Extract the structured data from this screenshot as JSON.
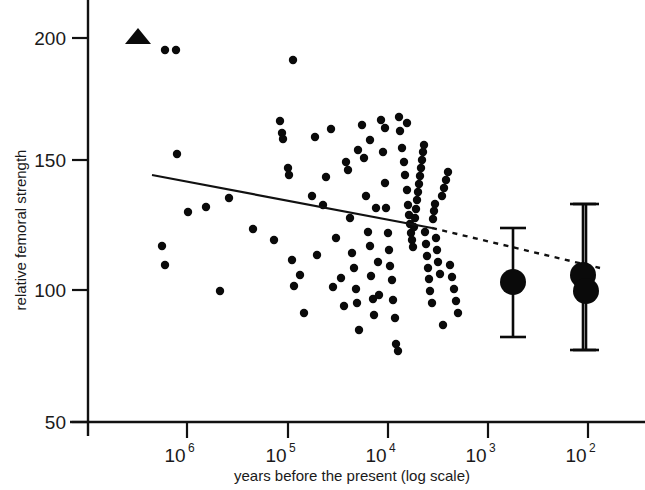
{
  "chart_data": {
    "type": "scatter",
    "title": "",
    "xlabel": "years before the present (log scale)",
    "ylabel": "relative femoral strength",
    "x_scale": "log-reversed",
    "x_tick_labels": [
      "10^6",
      "10^5",
      "10^4",
      "10^3",
      "10^2"
    ],
    "x_tick_bases": [
      "10",
      "10",
      "10",
      "10",
      "10"
    ],
    "x_tick_exponents": [
      "6",
      "5",
      "4",
      "3",
      "2"
    ],
    "x_tick_values": [
      1000000,
      100000,
      10000,
      1000,
      100
    ],
    "x_tick_px": [
      187,
      288,
      388,
      488,
      588
    ],
    "xlim_exponent": [
      6.98,
      1.42
    ],
    "y_tick_labels": [
      "200",
      "150",
      "100",
      "50"
    ],
    "y_tick_values": [
      200,
      150,
      100,
      50
    ],
    "y_tick_px": [
      38,
      160,
      290,
      422
    ],
    "ylim": [
      50,
      212
    ],
    "grid": false,
    "legend": false,
    "series": [
      {
        "name": "individual specimens",
        "marker": "small-filled-circle",
        "color": "#0a0a0a",
        "points_px": [
          [
            165,
            50
          ],
          [
            176,
            50
          ],
          [
            177,
            154
          ],
          [
            162,
            246
          ],
          [
            165,
            265
          ],
          [
            188,
            212
          ],
          [
            206,
            207
          ],
          [
            220,
            291
          ],
          [
            229,
            198
          ],
          [
            253,
            229
          ],
          [
            274,
            240
          ],
          [
            293,
            60
          ],
          [
            280,
            121
          ],
          [
            282,
            133
          ],
          [
            283,
            139
          ],
          [
            288,
            168
          ],
          [
            289,
            175
          ],
          [
            292,
            260
          ],
          [
            294,
            286
          ],
          [
            300,
            275
          ],
          [
            304,
            313
          ],
          [
            312,
            196
          ],
          [
            315,
            137
          ],
          [
            317,
            255
          ],
          [
            323,
            205
          ],
          [
            326,
            177
          ],
          [
            331,
            129
          ],
          [
            333,
            287
          ],
          [
            336,
            238
          ],
          [
            341,
            278
          ],
          [
            344,
            306
          ],
          [
            348,
            170
          ],
          [
            350,
            218
          ],
          [
            352,
            253
          ],
          [
            354,
            268
          ],
          [
            356,
            289
          ],
          [
            357,
            303
          ],
          [
            359,
            330
          ],
          [
            362,
            125
          ],
          [
            364,
            158
          ],
          [
            366,
            196
          ],
          [
            368,
            232
          ],
          [
            370,
            246
          ],
          [
            371,
            276
          ],
          [
            373,
            299
          ],
          [
            374,
            315
          ],
          [
            376,
            208
          ],
          [
            378,
            262
          ],
          [
            379,
            295
          ],
          [
            381,
            120
          ],
          [
            383,
            152
          ],
          [
            385,
            183
          ],
          [
            386,
            208
          ],
          [
            388,
            233
          ],
          [
            389,
            250
          ],
          [
            390,
            266
          ],
          [
            392,
            280
          ],
          [
            393,
            300
          ],
          [
            395,
            318
          ],
          [
            396,
            344
          ],
          [
            398,
            351
          ],
          [
            400,
            131
          ],
          [
            402,
            148
          ],
          [
            404,
            162
          ],
          [
            405,
            175
          ],
          [
            407,
            190
          ],
          [
            408,
            205
          ],
          [
            409,
            215
          ],
          [
            410,
            224
          ],
          [
            411,
            233
          ],
          [
            412,
            240
          ],
          [
            413,
            247
          ],
          [
            414,
            227
          ],
          [
            415,
            218
          ],
          [
            416,
            209
          ],
          [
            417,
            200
          ],
          [
            418,
            192
          ],
          [
            419,
            184
          ],
          [
            420,
            176
          ],
          [
            421,
            168
          ],
          [
            422,
            160
          ],
          [
            423,
            152
          ],
          [
            424,
            145
          ],
          [
            425,
            232
          ],
          [
            426,
            244
          ],
          [
            427,
            256
          ],
          [
            428,
            268
          ],
          [
            429,
            279
          ],
          [
            430,
            291
          ],
          [
            432,
            303
          ],
          [
            433,
            219
          ],
          [
            434,
            211
          ],
          [
            435,
            204
          ],
          [
            436,
            238
          ],
          [
            437,
            250
          ],
          [
            438,
            262
          ],
          [
            440,
            274
          ],
          [
            442,
            196
          ],
          [
            444,
            188
          ],
          [
            446,
            180
          ],
          [
            448,
            172
          ],
          [
            450,
            265
          ],
          [
            452,
            277
          ],
          [
            454,
            289
          ],
          [
            456,
            301
          ],
          [
            458,
            313
          ],
          [
            443,
            325
          ],
          [
            407,
            123
          ],
          [
            399,
            117
          ],
          [
            385,
            128
          ],
          [
            370,
            140
          ],
          [
            358,
            150
          ],
          [
            346,
            162
          ]
        ]
      },
      {
        "name": "group means with error bars",
        "marker": "large-filled-circle",
        "color": "#0a0a0a",
        "points_px": [
          {
            "cx": 513,
            "cy": 282,
            "r": 13,
            "top": 228,
            "bottom": 337,
            "x_value": 1000,
            "y_value": 104
          },
          {
            "cx": 583,
            "cy": 275,
            "r": 13,
            "top": 204,
            "bottom": 350,
            "x_value": 100,
            "y_value": 106
          },
          {
            "cx": 586,
            "cy": 291,
            "r": 13,
            "top": 204,
            "bottom": 350,
            "x_value": 100,
            "y_value": 100
          }
        ]
      },
      {
        "name": "outlier taxon",
        "marker": "filled-triangle",
        "color": "#0a0a0a",
        "points_px": [
          [
            138,
            36
          ]
        ],
        "x_value": 3000000,
        "y_value": 200
      }
    ],
    "trend_line": {
      "style": "solid-then-dashed",
      "solid_px": [
        [
          152,
          175
        ],
        [
          432,
          228
        ]
      ],
      "dashed_px": [
        [
          432,
          228
        ],
        [
          600,
          268
        ]
      ],
      "description": "declining regression of relative femoral strength over time"
    }
  }
}
